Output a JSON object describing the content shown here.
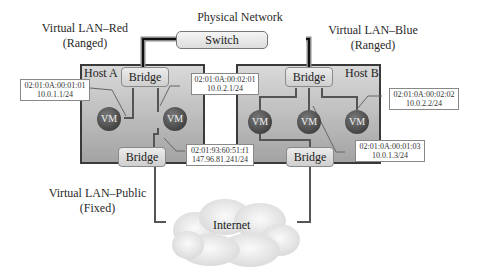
{
  "diagram": {
    "physical_network": {
      "title": "Physical Network",
      "switch_label": "Switch"
    },
    "vlans": {
      "red": {
        "name": "Virtual LAN–Red",
        "mode": "(Ranged)"
      },
      "blue": {
        "name": "Virtual LAN–Blue",
        "mode": "(Ranged)"
      },
      "public": {
        "name": "Virtual LAN–Public",
        "mode": "(Fixed)"
      }
    },
    "hosts": [
      {
        "label": "Host A",
        "top_bridge": "Bridge",
        "bottom_bridge": "Bridge",
        "vms": [
          "VM",
          "VM"
        ]
      },
      {
        "label": "Host B",
        "top_bridge": "Bridge",
        "bottom_bridge": "Bridge",
        "vms": [
          "VM",
          "VM",
          "VM"
        ]
      }
    ],
    "addresses": [
      {
        "mac": "02:01:0A:00:01:01",
        "ip": "10.0.1.1/24"
      },
      {
        "mac": "02:01:0A:00:02:01",
        "ip": "10.0.2.1/24"
      },
      {
        "mac": "02:01:93:60:51:f1",
        "ip": "147.96.81.241/24"
      },
      {
        "mac": "02:01:0A:00:02:02",
        "ip": "10.0.2.2/24"
      },
      {
        "mac": "02:01:0A:00:01:03",
        "ip": "10.0.1.3/24"
      }
    ],
    "internet_label": "Internet"
  }
}
